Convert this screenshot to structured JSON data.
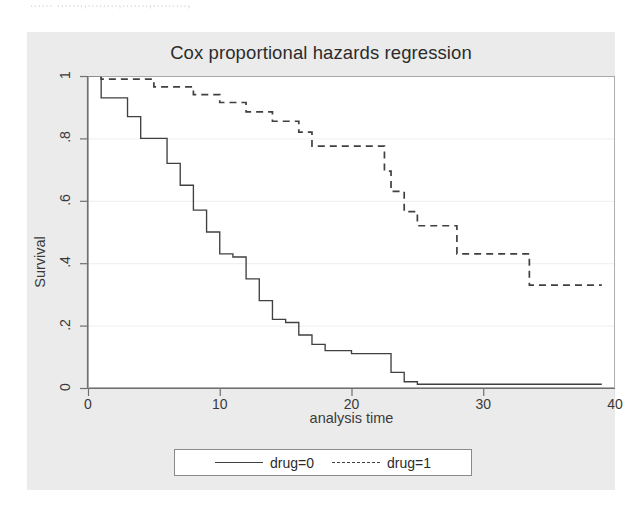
{
  "artifact_text": "......   .......,........,.......,.........,",
  "chart_data": {
    "type": "line",
    "subtype": "kaplan-meier-step",
    "title": "Cox proportional hazards regression",
    "xlabel": "analysis time",
    "ylabel": "Survival",
    "xlim": [
      0,
      40
    ],
    "ylim": [
      0,
      1
    ],
    "xticks": [
      0,
      10,
      20,
      30,
      40
    ],
    "xticklabels": [
      "0",
      "10",
      "20",
      "30",
      "40"
    ],
    "yticks": [
      0,
      0.2,
      0.4,
      0.6,
      0.8,
      1
    ],
    "yticklabels": [
      "0",
      ".2",
      ".4",
      ".6",
      ".8",
      "1"
    ],
    "grid": "horizontal",
    "legend_position": "bottom-center",
    "line_color": "#404040",
    "plot_bg": "#ffffff",
    "graph_bg": "#ebebeb",
    "series": [
      {
        "name": "drug=0",
        "style": "solid",
        "x": [
          1,
          2,
          3,
          4,
          5,
          6,
          7,
          8,
          9,
          10,
          11,
          12,
          13,
          14,
          16,
          17,
          18,
          19,
          20,
          22,
          23,
          25,
          39
        ],
        "y": [
          0.93,
          0.93,
          0.87,
          0.8,
          0.8,
          0.73,
          0.66,
          0.58,
          0.5,
          0.43,
          0.43,
          0.37,
          0.3,
          0.25,
          0.21,
          0.17,
          0.13,
          0.11,
          0.11,
          0.11,
          0.06,
          0.03,
          0.01
        ],
        "steps": [
          {
            "t": 0,
            "s": 1.0
          },
          {
            "t": 1,
            "s": 0.93
          },
          {
            "t": 3,
            "s": 0.87
          },
          {
            "t": 4,
            "s": 0.8
          },
          {
            "t": 6,
            "s": 0.72
          },
          {
            "t": 7,
            "s": 0.65
          },
          {
            "t": 8,
            "s": 0.57
          },
          {
            "t": 9,
            "s": 0.5
          },
          {
            "t": 10,
            "s": 0.43
          },
          {
            "t": 11,
            "s": 0.42
          },
          {
            "t": 12,
            "s": 0.35
          },
          {
            "t": 13,
            "s": 0.28
          },
          {
            "t": 14,
            "s": 0.22
          },
          {
            "t": 15,
            "s": 0.21
          },
          {
            "t": 16,
            "s": 0.17
          },
          {
            "t": 17,
            "s": 0.14
          },
          {
            "t": 18,
            "s": 0.12
          },
          {
            "t": 20,
            "s": 0.11
          },
          {
            "t": 22,
            "s": 0.11
          },
          {
            "t": 23,
            "s": 0.05
          },
          {
            "t": 24,
            "s": 0.02
          },
          {
            "t": 25,
            "s": 0.012
          },
          {
            "t": 39,
            "s": 0.012
          }
        ]
      },
      {
        "name": "drug=1",
        "style": "dashed",
        "x": [
          1,
          5,
          8,
          10,
          12,
          14,
          16,
          17,
          22,
          23,
          24,
          25,
          26,
          28,
          33,
          39
        ],
        "y": [
          0.99,
          0.96,
          0.93,
          0.91,
          0.87,
          0.84,
          0.79,
          0.77,
          0.77,
          0.7,
          0.63,
          0.57,
          0.52,
          0.43,
          0.33,
          0.33
        ],
        "steps": [
          {
            "t": 0,
            "s": 1.0
          },
          {
            "t": 1,
            "s": 0.99
          },
          {
            "t": 5,
            "s": 0.965
          },
          {
            "t": 8,
            "s": 0.94
          },
          {
            "t": 10,
            "s": 0.915
          },
          {
            "t": 12,
            "s": 0.885
          },
          {
            "t": 14,
            "s": 0.855
          },
          {
            "t": 16,
            "s": 0.82
          },
          {
            "t": 17,
            "s": 0.775
          },
          {
            "t": 22,
            "s": 0.775
          },
          {
            "t": 22.5,
            "s": 0.695
          },
          {
            "t": 23,
            "s": 0.63
          },
          {
            "t": 24,
            "s": 0.565
          },
          {
            "t": 25,
            "s": 0.52
          },
          {
            "t": 26,
            "s": 0.52
          },
          {
            "t": 28,
            "s": 0.43
          },
          {
            "t": 33,
            "s": 0.43
          },
          {
            "t": 33.5,
            "s": 0.33
          },
          {
            "t": 39,
            "s": 0.33
          }
        ]
      }
    ]
  },
  "legend": {
    "entries": [
      {
        "label": "drug=0",
        "style": "solid"
      },
      {
        "label": "drug=1",
        "style": "dashed"
      }
    ]
  }
}
